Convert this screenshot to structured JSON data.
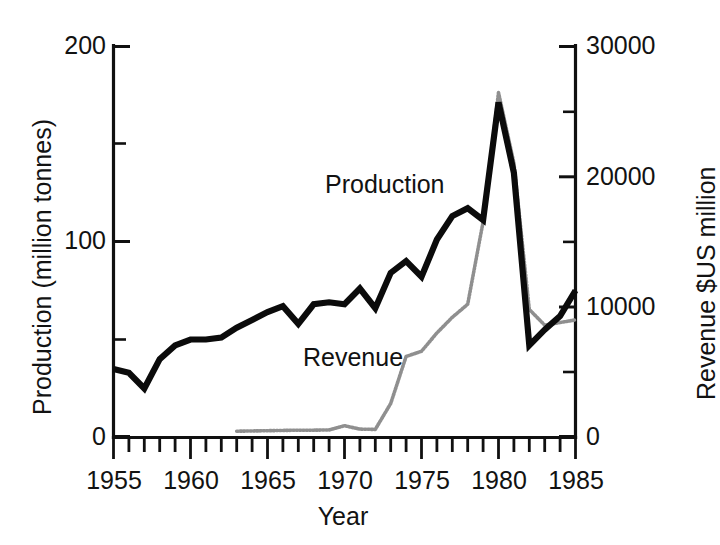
{
  "chart_data": {
    "type": "line",
    "title": "",
    "xlabel": "Year",
    "ylabel": "Production (million tonnes)",
    "y2label": "Revenue $US million",
    "xlim": [
      1955,
      1985
    ],
    "ylim": [
      0,
      200
    ],
    "y2lim": [
      0,
      30000
    ],
    "grid": false,
    "legend_position": "inline-annotation",
    "x_tick_labels": [
      "1955",
      "1960",
      "1965",
      "1970",
      "1975",
      "1980",
      "1985"
    ],
    "x_tick_values": [
      1955,
      1960,
      1965,
      1970,
      1975,
      1980,
      1985
    ],
    "x_minor_step": 1,
    "y_tick_labels": [
      "0",
      "100",
      "200"
    ],
    "y_tick_values": [
      0,
      100,
      200
    ],
    "y_minor_values": [
      50,
      150
    ],
    "y2_tick_labels": [
      "0",
      "10000",
      "20000",
      "30000"
    ],
    "y2_tick_values": [
      0,
      10000,
      20000,
      30000
    ],
    "y2_minor_values": [
      5000,
      15000,
      25000
    ],
    "annotations": [
      {
        "text": "Production",
        "x": 1972.0,
        "y": 128.0
      },
      {
        "text": "Revenue",
        "x": 1970.3,
        "y": 44.0
      }
    ],
    "series": [
      {
        "name": "Production",
        "axis": "left",
        "units": "million tonnes",
        "style": "solid-thick-black",
        "color": "#0b0b0b",
        "x": [
          1955,
          1956,
          1957,
          1958,
          1959,
          1960,
          1961,
          1962,
          1963,
          1964,
          1965,
          1966,
          1967,
          1968,
          1969,
          1970,
          1971,
          1972,
          1973,
          1974,
          1975,
          1976,
          1977,
          1978,
          1979,
          1980,
          1981,
          1982,
          1983,
          1984,
          1985
        ],
        "values": [
          35,
          33,
          25,
          40,
          47,
          50,
          50,
          51,
          56,
          60,
          64,
          67,
          58,
          68,
          69,
          68,
          76,
          66,
          84,
          90,
          82,
          101,
          113,
          117,
          111,
          171,
          135,
          47,
          55,
          62,
          75
        ]
      },
      {
        "name": "Revenue",
        "axis": "right",
        "units": "$US million",
        "style": "dotted-grey",
        "color": "#8f8f8f",
        "x": [
          1963,
          1964,
          1965,
          1966,
          1967,
          1968,
          1969,
          1970,
          1971,
          1972,
          1973,
          1974,
          1975,
          1976,
          1977,
          1978,
          1979,
          1980,
          1981,
          1982,
          1983,
          1984,
          1985
        ],
        "values": [
          480,
          500,
          520,
          540,
          560,
          560,
          580,
          900,
          640,
          620,
          2600,
          6200,
          6600,
          8000,
          9200,
          10200,
          16500,
          26400,
          21000,
          9800,
          8600,
          8800,
          9000
        ]
      }
    ]
  },
  "axes": {
    "left": {
      "title": "Production (million tonnes)",
      "ticks": [
        "200",
        "100",
        "0"
      ]
    },
    "right": {
      "title": "Revenue $US million",
      "ticks": [
        "30000",
        "20000",
        "10000",
        "0"
      ]
    },
    "bottom": {
      "title": "Year",
      "ticks": [
        "1955",
        "1960",
        "1965",
        "1970",
        "1975",
        "1980",
        "1985"
      ]
    }
  },
  "labels": {
    "production": "Production",
    "revenue": "Revenue"
  },
  "colors": {
    "background": "#ffffff",
    "axis": "#101010",
    "production_line": "#0b0b0b",
    "revenue_line": "#8f8f8f",
    "text": "#121212"
  }
}
